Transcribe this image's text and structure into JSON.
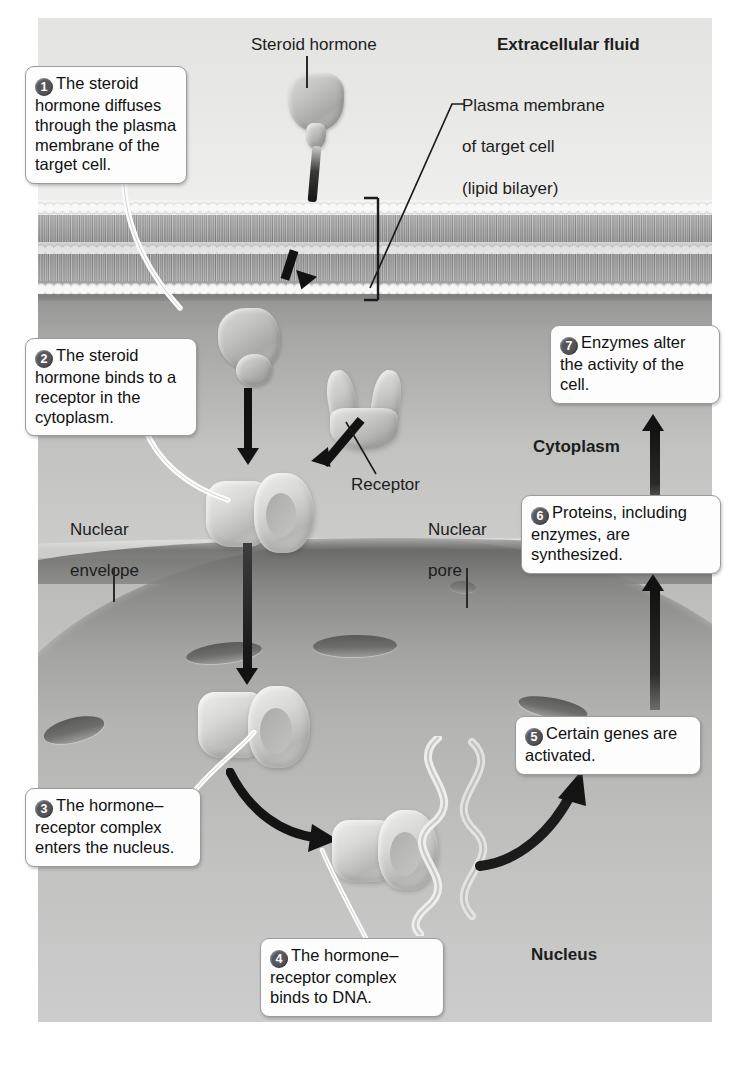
{
  "diagram": {
    "region_labels": [
      {
        "id": "extracellular-fluid",
        "text": "Extracellular fluid",
        "style": "bold"
      },
      {
        "id": "cytoplasm",
        "text": "Cytoplasm",
        "style": "bold"
      },
      {
        "id": "nucleus",
        "text": "Nucleus",
        "style": "bold"
      }
    ],
    "part_labels": [
      {
        "id": "steroid-hormone",
        "text": "Steroid hormone"
      },
      {
        "id": "plasma-membrane",
        "lines": [
          "Plasma membrane",
          "of target cell",
          "(lipid bilayer)"
        ]
      },
      {
        "id": "receptor",
        "text": "Receptor"
      },
      {
        "id": "nuclear-envelope",
        "lines": [
          "Nuclear",
          "envelope"
        ]
      },
      {
        "id": "nuclear-pore",
        "lines": [
          "Nuclear",
          "pore"
        ]
      }
    ],
    "steps": [
      {
        "num": "1",
        "text": "The steroid hormone diffuses through the plasma membrane of the target cell."
      },
      {
        "num": "2",
        "text": "The steroid hormone binds to a receptor in the cytoplasm."
      },
      {
        "num": "3",
        "text": "The hormone–receptor complex enters the nucleus."
      },
      {
        "num": "4",
        "text": "The hormone–receptor complex binds to DNA."
      },
      {
        "num": "5",
        "text": "Certain genes are activated."
      },
      {
        "num": "6",
        "text": "Proteins, including enzymes, are synthesized."
      },
      {
        "num": "7",
        "text": "Enzymes alter the activity of the cell."
      }
    ],
    "colors": {
      "badge": "#56565a",
      "callout_bg": "#fdfdfd",
      "callout_border": "#9b9b9b",
      "arrow": "#121212",
      "extracellular": "#e8e8e6",
      "cytoplasm": "#b2b2b1",
      "nucleus": "#cccccb",
      "envelope": "#7d7d7c"
    }
  }
}
